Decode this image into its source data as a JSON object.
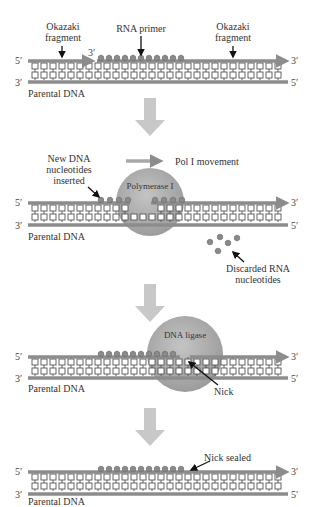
{
  "colors": {
    "strand": "#8c8c8c",
    "nucleotide_box": "#ffffff",
    "rna_bead": "#8a8a8a",
    "enzyme": "#a8a8a8",
    "step_arrow": "#c8c8c8",
    "label_text": "#333333"
  },
  "panels": [
    {
      "id": "step1",
      "labels": {
        "okazaki_left": "Okazaki fragment",
        "rna_primer": "RNA primer",
        "okazaki_right": "Okazaki fragment",
        "parental": "Parental DNA"
      },
      "ends": {
        "top_left": "5′",
        "top_right": "3′",
        "bottom_left": "3′",
        "bottom_right": "5′",
        "primer_start": "3′"
      }
    },
    {
      "id": "step2",
      "labels": {
        "inserted": "New DNA nucleotides inserted",
        "movement": "Pol I movement",
        "enzyme": "Polymerase I",
        "parental": "Parental DNA",
        "discarded": "Discarded RNA nucleotides"
      },
      "ends": {
        "top_left": "5′",
        "top_right": "3′",
        "bottom_left": "3′",
        "bottom_right": "5′"
      }
    },
    {
      "id": "step3",
      "labels": {
        "enzyme": "DNA ligase",
        "nick": "Nick",
        "parental": "Parental DNA"
      },
      "ends": {
        "top_left": "5′",
        "top_right": "3′",
        "bottom_left": "3′",
        "bottom_right": "5′"
      }
    },
    {
      "id": "step4",
      "labels": {
        "nick_sealed": "Nick sealed",
        "parental": "Parental DNA"
      },
      "ends": {
        "top_left": "5′",
        "top_right": "3′",
        "bottom_left": "3′",
        "bottom_right": "5′"
      }
    }
  ]
}
